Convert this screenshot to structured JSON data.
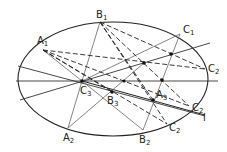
{
  "diagram": {
    "ellipse": {
      "cx": 113,
      "cy": 79,
      "rx": 95,
      "ry": 57
    },
    "points": {
      "A1": {
        "x": 43,
        "y": 50,
        "label": "A",
        "sub": "1"
      },
      "B1": {
        "x": 100,
        "y": 22,
        "label": "B",
        "sub": "1"
      },
      "C1": {
        "x": 180,
        "y": 34,
        "label": "C",
        "sub": "1"
      },
      "C2a": {
        "x": 205,
        "y": 69,
        "label": "C",
        "sub": "2"
      },
      "C3": {
        "x": 82,
        "y": 81,
        "label": "C",
        "sub": "3"
      },
      "B3": {
        "x": 112,
        "y": 92,
        "label": "B",
        "sub": "3"
      },
      "A3": {
        "x": 153,
        "y": 100,
        "label": "A",
        "sub": "3"
      },
      "A2": {
        "x": 68,
        "y": 128,
        "label": "A",
        "sub": "2"
      },
      "B2": {
        "x": 143,
        "y": 130,
        "label": "B",
        "sub": "2"
      },
      "C2b": {
        "x": 167,
        "y": 124,
        "label": "C",
        "sub": "2"
      },
      "C2c": {
        "x": 189,
        "y": 106,
        "label": "C",
        "sub": "2"
      }
    },
    "line_label": "l",
    "colors": {
      "stroke": "#222222",
      "solid_gray": "#555555",
      "dot": "#111111"
    }
  }
}
